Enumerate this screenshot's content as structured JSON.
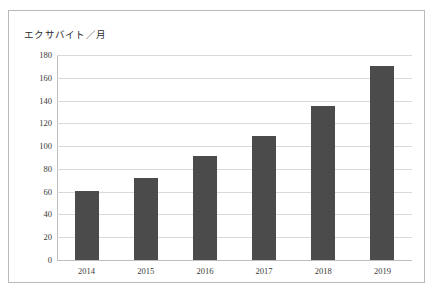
{
  "chart_data": {
    "type": "bar",
    "title": "",
    "subtitle": "",
    "ylabel": "エクサバイト／月",
    "xlabel": "",
    "categories": [
      "2014",
      "2015",
      "2016",
      "2017",
      "2018",
      "2019"
    ],
    "values": [
      61,
      72,
      91,
      109,
      135,
      170
    ],
    "series": [
      {
        "name": "エクサバイト／月",
        "values": [
          61,
          72,
          91,
          109,
          135,
          170
        ]
      }
    ],
    "ylim": [
      0,
      180
    ],
    "yticks": [
      0,
      20,
      40,
      60,
      80,
      100,
      120,
      140,
      160,
      180
    ],
    "ytick_labels": [
      "0",
      "20",
      "40",
      "60",
      "80",
      "100",
      "120",
      "140",
      "160",
      "180"
    ],
    "grid": true,
    "grid_axis": "y",
    "legend": false,
    "legend_position": "none",
    "bar_color": "#4b4b4b",
    "grid_color": "#d9d9d9",
    "axis_color": "#bdbdbd",
    "frame_color": "#b9b9b9",
    "background_color": "#ffffff",
    "annotations": []
  }
}
